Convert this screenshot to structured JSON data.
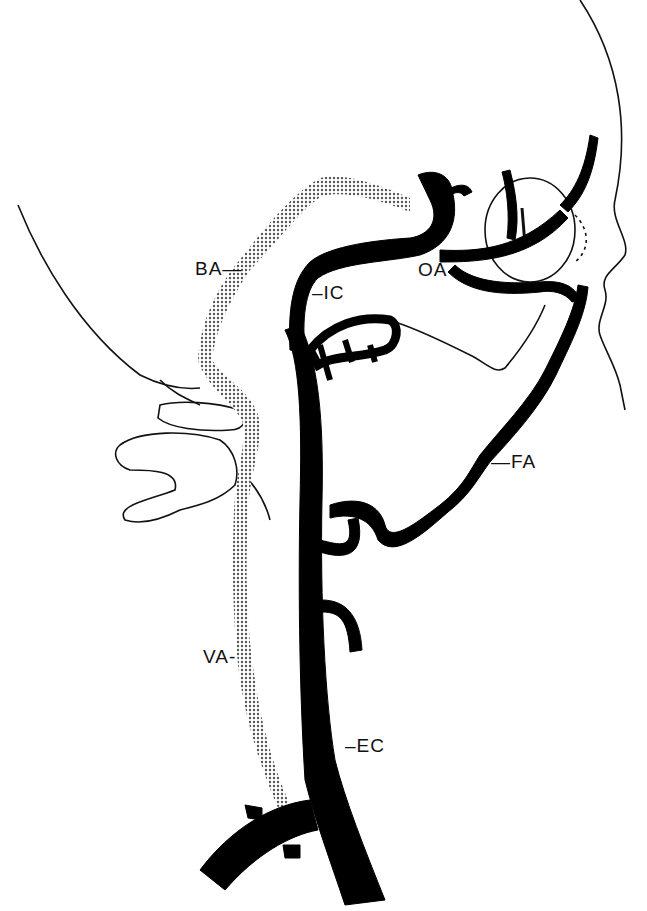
{
  "diagram": {
    "title": "",
    "type": "anatomical illustration - carotid and vertebral arteries, lateral view",
    "colors": {
      "artery": "#000000",
      "outline": "#111111",
      "vertebral_stipple": "#9a9a9a",
      "background": "#ffffff"
    },
    "labels": [
      {
        "id": "BA",
        "text": "BA—",
        "x": 195,
        "y": 270
      },
      {
        "id": "IC",
        "text": "–IC",
        "x": 312,
        "y": 293
      },
      {
        "id": "OA",
        "text": "OA",
        "x": 418,
        "y": 260
      },
      {
        "id": "FA",
        "text": "—FA",
        "x": 491,
        "y": 452
      },
      {
        "id": "VA",
        "text": "VA-",
        "x": 203,
        "y": 648
      },
      {
        "id": "EC",
        "text": "–EC",
        "x": 345,
        "y": 735
      }
    ]
  }
}
